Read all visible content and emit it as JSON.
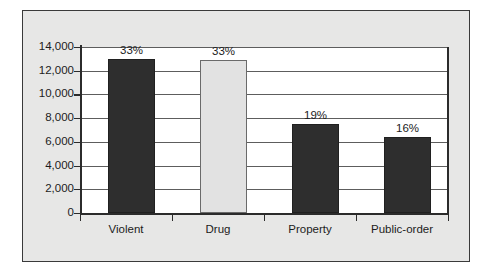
{
  "chart_data": {
    "type": "bar",
    "title": "",
    "subtitle": "",
    "xlabel": "",
    "ylabel": "",
    "categories": [
      "Violent",
      "Drug",
      "Property",
      "Public-order"
    ],
    "values": [
      13000,
      12900,
      7500,
      6400
    ],
    "data_labels": [
      "33%",
      "33%",
      "19%",
      "16%"
    ],
    "ylim": [
      0,
      14000
    ],
    "ytick_values": [
      0,
      2000,
      4000,
      6000,
      8000,
      10000,
      12000,
      14000
    ],
    "ytick_labels": [
      "0",
      "2,000",
      "4,000",
      "6,000",
      "8,000",
      "10,000",
      "12,000",
      "14,000"
    ],
    "grid": true,
    "grid_axis": "y",
    "legend": false,
    "legend_position": "none",
    "bar_colors": [
      "#2e2e2e",
      "#e2e2e2",
      "#2e2e2e",
      "#2e2e2e"
    ],
    "bar_styles": [
      "dark",
      "light",
      "dark",
      "dark"
    ],
    "annotations": []
  },
  "colors": {
    "panel_background": "#e7e7e6",
    "panel_border": "#3a3a3a",
    "plot_background": "#ffffff",
    "gridline": "#5d5d5d",
    "axis": "#2b2b2b",
    "text": "#1c1c1c",
    "bar_dark": "#2e2e2e",
    "bar_light": "#e2e2e2"
  }
}
